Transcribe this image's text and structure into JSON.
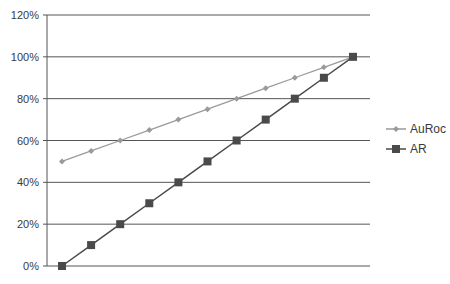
{
  "chart_data": {
    "type": "line",
    "title": "",
    "xlabel": "",
    "ylabel": "",
    "x": [
      1,
      2,
      3,
      4,
      5,
      6,
      7,
      8,
      9,
      10,
      11
    ],
    "ylim": [
      0,
      120
    ],
    "yticks": [
      0,
      20,
      40,
      60,
      80,
      100,
      120
    ],
    "ytick_labels": [
      "0%",
      "20%",
      "40%",
      "60%",
      "80%",
      "100%",
      "120%"
    ],
    "grid": true,
    "legend_position": "right",
    "series": [
      {
        "name": "AuRoc",
        "marker": "diamond",
        "color": "#9a9a9a",
        "values": [
          50,
          55,
          60,
          65,
          70,
          75,
          80,
          85,
          90,
          95,
          100
        ]
      },
      {
        "name": "AR",
        "marker": "square",
        "color": "#4a4a4a",
        "values": [
          0,
          10,
          20,
          30,
          40,
          50,
          60,
          70,
          80,
          90,
          100
        ]
      }
    ]
  }
}
